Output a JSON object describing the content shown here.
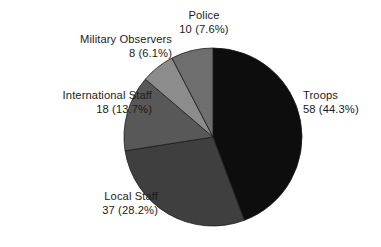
{
  "chart_data": {
    "type": "pie",
    "title": "",
    "subtitle": "",
    "xlabel": "",
    "ylabel": "",
    "grid": false,
    "legend_position": "none",
    "label_style": "outside-no-leader",
    "total": 131,
    "categories": [
      "Troops",
      "Local Staff",
      "International Staff",
      "Military Observers",
      "Police"
    ],
    "values": [
      58,
      37,
      18,
      8,
      10
    ],
    "percentages": [
      44.3,
      28.2,
      13.7,
      6.1,
      7.6
    ],
    "start_angle_deg": 0,
    "direction": "clockwise",
    "slices": [
      {
        "name": "Troops",
        "value": 58,
        "percent": 44.3,
        "label_line1": "Troops",
        "label_line2": "58 (44.3%)",
        "color": "#0d0d0d"
      },
      {
        "name": "Local Staff",
        "value": 37,
        "percent": 28.2,
        "label_line1": "Local Staff",
        "label_line2": "37 (28.2%)",
        "color": "#3f3f3f"
      },
      {
        "name": "International Staff",
        "value": 18,
        "percent": 13.7,
        "label_line1": "International Staff",
        "label_line2": "18 (13.7%)",
        "color": "#585858"
      },
      {
        "name": "Military Observers",
        "value": 8,
        "percent": 6.1,
        "label_line1": "Military Observers",
        "label_line2": "8 (6.1%)",
        "color": "#8c8c8c"
      },
      {
        "name": "Police",
        "value": 10,
        "percent": 7.6,
        "label_line1": "Police",
        "label_line2": "10 (7.6%)",
        "color": "#6e6e6e"
      }
    ],
    "geometry": {
      "center_x": 213,
      "center_y": 137,
      "radius": 89
    },
    "colors": {
      "background": "#ffffff",
      "text": "#1b1b1b",
      "slice_border": "#1a1a1a"
    }
  }
}
